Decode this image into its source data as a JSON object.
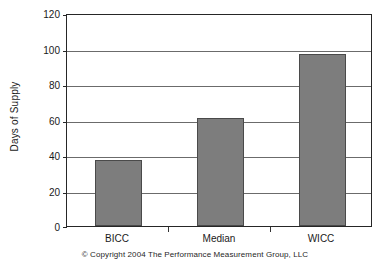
{
  "chart_data": {
    "type": "bar",
    "title": "",
    "xlabel": "",
    "ylabel": "Days of Supply",
    "categories": [
      "BICC",
      "Median",
      "WICC"
    ],
    "values": [
      37,
      61,
      97
    ],
    "ylim": [
      0,
      120
    ],
    "yticks": [
      0,
      20,
      40,
      60,
      80,
      100,
      120
    ],
    "ytick_labels": [
      "0",
      "20",
      "40",
      "60",
      "80",
      "100",
      "120"
    ],
    "grid": "horizontal",
    "legend": "none",
    "bar_color": "#7d7d7d",
    "bar_edge_color": "#4a4a4a",
    "axis_color": "#262626",
    "gridline_color": "#6b6b6b"
  },
  "caption": {
    "text": "© Copyright 2004 The Performance Measurement Group, LLC"
  }
}
